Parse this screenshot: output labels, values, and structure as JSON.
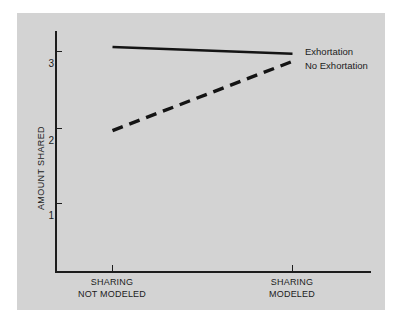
{
  "chart_data": {
    "type": "line",
    "title": "",
    "xlabel": "",
    "ylabel": "AMOUNT SHARED",
    "categories": [
      "SHARING NOT MODELED",
      "SHARING MODELED"
    ],
    "category_lines": [
      [
        "SHARING",
        "NOT MODELED"
      ],
      [
        "SHARING",
        "MODELED"
      ]
    ],
    "x": [
      1,
      2
    ],
    "ylim": [
      0,
      3.45
    ],
    "yticks": [
      1,
      2,
      3
    ],
    "ytick_labels": [
      "1",
      "2",
      "3"
    ],
    "grid": false,
    "legend_position": "right-inline",
    "series": [
      {
        "name": "Exhortation",
        "style": "solid",
        "color": "#141414",
        "values": [
          3.06,
          2.97
        ]
      },
      {
        "name": "No Exhortation",
        "style": "dashed",
        "color": "#141414",
        "values": [
          1.96,
          2.87
        ]
      }
    ],
    "annotations": []
  },
  "figure": {
    "panel_color": "#d3d3d3",
    "page_color": "#ffffff",
    "axis_color": "#1c1c1c"
  },
  "axis": {
    "y_label": "AMOUNT SHARED",
    "y_tick_1": "1",
    "y_tick_2": "2",
    "y_tick_3": "3"
  },
  "xaxis": {
    "cat0_line1": "SHARING",
    "cat0_line2": "NOT MODELED",
    "cat1_line1": "SHARING",
    "cat1_line2": "MODELED"
  },
  "legend": {
    "item0": "Exhortation",
    "item1": "No Exhortation"
  }
}
